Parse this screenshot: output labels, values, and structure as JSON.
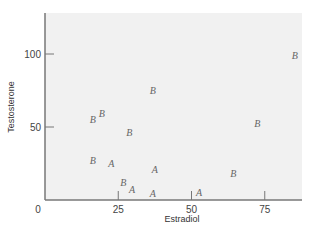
{
  "chart_data": {
    "type": "scatter",
    "title": "",
    "xlabel": "Estradiol",
    "ylabel": "Testosterone",
    "xlim": [
      0,
      88
    ],
    "ylim": [
      0,
      127
    ],
    "xticks": [
      0,
      25,
      50,
      75
    ],
    "yticks": [
      50,
      100
    ],
    "grid": false,
    "legend": null,
    "marker_style": "letters",
    "series": [
      {
        "name": "A",
        "points": [
          {
            "x": 22.6,
            "y": 25.1
          },
          {
            "x": 37.5,
            "y": 21.2
          },
          {
            "x": 29.7,
            "y": 7.3
          },
          {
            "x": 36.8,
            "y": 5.0
          },
          {
            "x": 52.6,
            "y": 5.7
          }
        ]
      },
      {
        "name": "B",
        "points": [
          {
            "x": 16.3,
            "y": 55.3
          },
          {
            "x": 19.4,
            "y": 59.8
          },
          {
            "x": 28.8,
            "y": 46.4
          },
          {
            "x": 16.3,
            "y": 27.4
          },
          {
            "x": 26.7,
            "y": 12.5
          },
          {
            "x": 36.8,
            "y": 75.3
          },
          {
            "x": 64.3,
            "y": 18.3
          },
          {
            "x": 85.3,
            "y": 99.3
          },
          {
            "x": 72.5,
            "y": 52.5
          }
        ]
      }
    ]
  },
  "colors": {
    "plot_background": "#f1f1f1",
    "axis": "#777777",
    "marker": "#666666"
  }
}
